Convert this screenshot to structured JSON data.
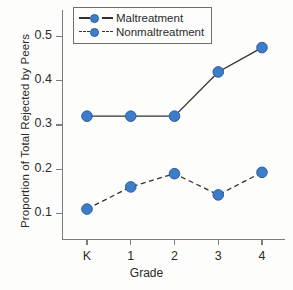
{
  "chart_data": {
    "type": "line",
    "title": "",
    "xlabel": "Grade",
    "ylabel": "Proportion of Total Rejected by Peers",
    "categories": [
      "K",
      "1",
      "2",
      "3",
      "4"
    ],
    "xtick_labels": [
      "K",
      "1",
      "2",
      "3",
      "4"
    ],
    "ytick_labels": [
      "0.1",
      "0.2",
      "0.3",
      "0.4",
      "0.5"
    ],
    "ytick_values": [
      0.1,
      0.2,
      0.3,
      0.4,
      0.5
    ],
    "ylim": [
      0.04,
      0.56
    ],
    "grid": false,
    "legend_position": "top-left",
    "series": [
      {
        "name": "Maltreatment",
        "values": [
          0.32,
          0.32,
          0.32,
          0.42,
          0.475
        ],
        "line_style": "solid",
        "line_color": "#33312f",
        "marker": "circle",
        "marker_color": "#3d7cc9"
      },
      {
        "name": "Nonmaltreatment",
        "values": [
          0.11,
          0.16,
          0.19,
          0.142,
          0.193
        ],
        "line_style": "dashed",
        "line_color": "#33312f",
        "marker": "circle",
        "marker_color": "#3d7cc9"
      }
    ]
  },
  "legend": {
    "entries": [
      {
        "label": "Maltreatment",
        "style": "solid"
      },
      {
        "label": "Nonmaltreatment",
        "style": "dashed"
      }
    ]
  },
  "colors": {
    "marker": "#3d7cc9",
    "marker_edge": "#2e5f9e",
    "line": "#33312f",
    "axis": "#7d7d7d",
    "text": "#2b2b2b",
    "background": "#fdfdfc"
  }
}
